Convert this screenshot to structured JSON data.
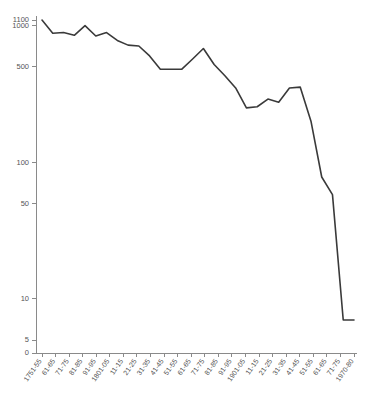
{
  "chart_data": {
    "type": "line",
    "title": "",
    "subtitle": "",
    "xlabel": "",
    "ylabel": "",
    "yscale": "log",
    "ylim": [
      5,
      1100
    ],
    "grid": false,
    "legend": null,
    "line_color": "#3a3a3a",
    "axis_color": "#8a8a8a",
    "tick_label_color": "#555555",
    "background_color": "#ffffff",
    "ytick_values": [
      0,
      5,
      10,
      50,
      100,
      500,
      1000,
      1100
    ],
    "ytick_labels": [
      "0",
      "5",
      "10",
      "50",
      "100",
      "500",
      "1000",
      "1100"
    ],
    "categories": [
      "1751-55",
      "61-65",
      "71-75",
      "81-85",
      "91-95",
      "1801-05",
      "11-15",
      "21-25",
      "31-35",
      "41-45",
      "51-55",
      "61-65",
      "71-75",
      "81-85",
      "91-95",
      "1901-05",
      "11-15",
      "21-25",
      "31-35",
      "41-45",
      "51-55",
      "61-65",
      "71-75",
      "1970-80"
    ],
    "series": [
      {
        "name": "rate",
        "values": [
          1100,
          880,
          890,
          850,
          1000,
          840,
          890,
          780,
          720,
          710,
          600,
          480,
          480,
          480,
          570,
          680,
          520,
          430,
          350,
          250,
          255,
          290,
          275,
          350
        ]
      }
    ],
    "extended_values": [
      1100,
      880,
      890,
      850,
      1000,
      840,
      890,
      780,
      720,
      710,
      600,
      480,
      480,
      480,
      570,
      680,
      520,
      430,
      350,
      250,
      255,
      290,
      275,
      350,
      355,
      200,
      78,
      58,
      7,
      7
    ]
  }
}
